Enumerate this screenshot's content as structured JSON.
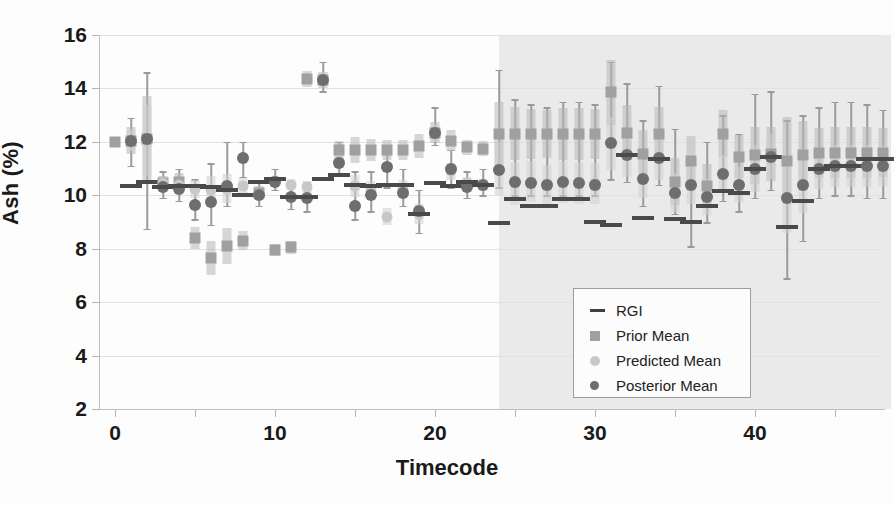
{
  "chart_data": {
    "type": "scatter",
    "title": "",
    "xlabel": "Timecode",
    "ylabel": "Ash (%)",
    "xlim": [
      -1,
      48
    ],
    "ylim": [
      2,
      16
    ],
    "xticks": [
      0,
      10,
      20,
      30,
      40
    ],
    "yticks": [
      2,
      4,
      6,
      8,
      10,
      12,
      14,
      16
    ],
    "grid": true,
    "legend_position": "center-right",
    "legend_entries": [
      "RGI",
      "Prior Mean",
      "Predicted Mean",
      "Posterior Mean"
    ],
    "annotations": [
      {
        "type": "shaded-region",
        "label": "forecast region",
        "x_start": 24,
        "x_end": 48.5,
        "color": "#e9e9e9"
      }
    ],
    "series": [
      {
        "name": "RGI",
        "marker": "dash",
        "color": "#4a4a4a",
        "values": [
          null,
          10.35,
          10.5,
          10.3,
          10.35,
          10.35,
          10.3,
          10.2,
          10.0,
          10.5,
          10.6,
          9.95,
          9.95,
          10.6,
          10.75,
          10.4,
          10.35,
          10.4,
          10.4,
          9.3,
          10.45,
          10.35,
          10.5,
          10.4,
          8.95,
          9.85,
          9.6,
          9.6,
          9.85,
          9.85,
          9.0,
          8.9,
          11.5,
          9.15,
          11.35,
          9.1,
          9.0,
          9.6,
          10.15,
          10.1,
          11.0,
          11.45,
          8.8,
          9.8,
          11.0,
          11.1,
          11.1,
          11.35,
          11.35
        ]
      },
      {
        "name": "Prior Mean",
        "marker": "square",
        "color": "#a0a0a0",
        "values": [
          12.0,
          12.05,
          12.1,
          10.45,
          10.5,
          8.4,
          7.65,
          8.1,
          8.3,
          10.1,
          7.95,
          8.05,
          14.35,
          14.3,
          11.7,
          11.7,
          11.7,
          11.7,
          11.7,
          11.85,
          12.35,
          12.05,
          11.8,
          11.75,
          12.3,
          12.3,
          12.3,
          12.3,
          12.3,
          12.3,
          12.3,
          13.85,
          12.35,
          11.55,
          12.3,
          10.5,
          11.3,
          10.35,
          12.3,
          11.45,
          11.5,
          11.55,
          11.3,
          11.5,
          11.6,
          11.6,
          11.6,
          11.6,
          11.6
        ]
      },
      {
        "name": "Predicted Mean",
        "marker": "circle",
        "color": "#c8c8c8",
        "values": [
          null,
          12.05,
          12.05,
          10.45,
          10.4,
          10.25,
          10.2,
          10.25,
          10.35,
          10.05,
          10.55,
          10.4,
          10.3,
          14.35,
          11.3,
          10.35,
          10.2,
          9.2,
          10.25,
          9.3,
          12.3,
          10.9,
          10.45,
          10.4,
          11.0,
          10.45,
          10.5,
          10.4,
          10.5,
          10.45,
          10.45,
          11.95,
          11.5,
          10.6,
          11.4,
          10.1,
          10.4,
          9.95,
          10.8,
          10.4,
          11.0,
          11.45,
          9.9,
          10.4,
          11.0,
          11.1,
          11.1,
          11.1,
          11.1
        ]
      },
      {
        "name": "Posterior Mean",
        "marker": "circle-dark",
        "color": "#6e6e6e",
        "values": [
          null,
          12.05,
          12.1,
          10.3,
          10.25,
          9.65,
          9.75,
          10.35,
          11.4,
          10.0,
          10.5,
          9.95,
          9.9,
          14.3,
          11.2,
          9.6,
          10.0,
          11.05,
          10.1,
          9.4,
          12.35,
          11.0,
          10.3,
          10.4,
          10.95,
          10.5,
          10.45,
          10.4,
          10.5,
          10.45,
          10.4,
          11.95,
          11.5,
          10.6,
          11.4,
          10.1,
          10.4,
          9.95,
          10.8,
          10.4,
          11.0,
          11.45,
          9.9,
          10.4,
          11.0,
          11.1,
          11.1,
          11.1,
          11.1
        ]
      }
    ],
    "uncertainty": {
      "description": "vertical whiskers and shaded interval bars per timecode",
      "prior_interval": [
        [
          12.0,
          12.0
        ],
        [
          11.1,
          12.9
        ],
        [
          8.75,
          14.6
        ],
        [
          9.9,
          10.9
        ],
        [
          9.8,
          11.0
        ],
        [
          9.1,
          10.6
        ],
        [
          8.9,
          11.2
        ],
        [
          9.6,
          12.0
        ],
        [
          10.7,
          12.0
        ],
        [
          9.6,
          10.5
        ],
        [
          10.2,
          11.0
        ],
        [
          9.5,
          10.4
        ],
        [
          9.4,
          10.5
        ],
        [
          13.9,
          15.0
        ],
        [
          10.8,
          12.0
        ],
        [
          9.1,
          10.9
        ],
        [
          9.4,
          10.9
        ],
        [
          10.3,
          11.7
        ],
        [
          9.6,
          11.0
        ],
        [
          8.6,
          10.2
        ],
        [
          11.9,
          13.3
        ],
        [
          10.3,
          11.7
        ],
        [
          9.9,
          10.9
        ],
        [
          10.0,
          11.0
        ],
        [
          10.3,
          14.7
        ],
        [
          10.0,
          13.6
        ],
        [
          10.0,
          13.4
        ],
        [
          10.0,
          13.3
        ],
        [
          10.0,
          13.5
        ],
        [
          10.0,
          13.5
        ],
        [
          10.0,
          13.4
        ],
        [
          10.6,
          15.0
        ],
        [
          10.5,
          14.2
        ],
        [
          9.6,
          12.8
        ],
        [
          10.4,
          14.1
        ],
        [
          9.3,
          12.5
        ],
        [
          8.1,
          11.4
        ],
        [
          9.0,
          12.0
        ],
        [
          9.8,
          13.0
        ],
        [
          9.4,
          12.3
        ],
        [
          9.9,
          13.8
        ],
        [
          10.2,
          13.9
        ],
        [
          6.9,
          12.8
        ],
        [
          8.3,
          13.0
        ],
        [
          9.9,
          13.3
        ],
        [
          10.0,
          13.5
        ],
        [
          10.0,
          13.5
        ],
        [
          9.9,
          13.4
        ],
        [
          9.9,
          13.2
        ]
      ]
    }
  },
  "axes": {
    "y_title": "Ash (%)",
    "x_title": "Timecode",
    "y_tick_labels": [
      "16",
      "14",
      "12",
      "10",
      "8",
      "6",
      "4",
      "2"
    ],
    "x_tick_labels": [
      "0",
      "10",
      "20",
      "30",
      "40"
    ]
  },
  "legend": {
    "items": [
      {
        "key": "dash-key-icon",
        "label": "RGI"
      },
      {
        "key": "square-key-icon",
        "label": "Prior Mean"
      },
      {
        "key": "light-circle-key-icon",
        "label": "Predicted Mean"
      },
      {
        "key": "dark-circle-key-icon",
        "label": "Posterior Mean"
      }
    ]
  },
  "colors": {
    "rgi": "#4a4a4a",
    "prior": "#a0a0a0",
    "predicted": "#c8c8c8",
    "posterior": "#6e6e6e",
    "forecast_band": "#e9e9e9",
    "grid": "#e2e2e2"
  }
}
